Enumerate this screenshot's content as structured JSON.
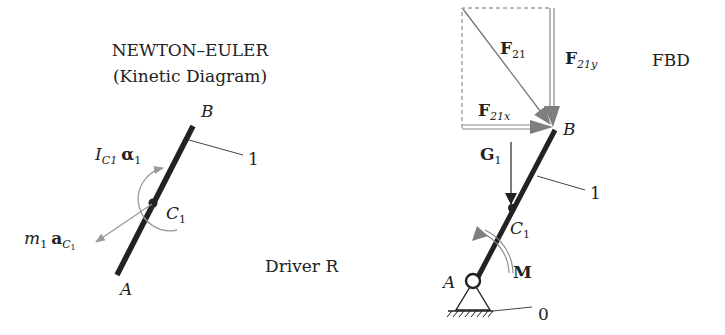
{
  "left_panel": {
    "title_line1": "NEWTON–EULER",
    "title_line2": "(Kinetic Diagram)",
    "point_B": "B",
    "point_A": "A",
    "point_C": "C",
    "point_C_sub": "1",
    "link_label": "1",
    "inertia_I": "I",
    "inertia_I_sub": "C1",
    "inertia_alpha": "α",
    "inertia_alpha_sub": "1",
    "mass_m": "m",
    "mass_m_sub": "1",
    "mass_a": "a",
    "mass_a_sub": "C",
    "mass_a_subsub": "1",
    "driver_label": "Driver R"
  },
  "right_panel": {
    "fbd_label": "FBD",
    "force_F": "F",
    "force_F21_sub": "21",
    "force_F21x_sub": "21x",
    "force_F21y_sub": "21y",
    "gravity_G": "G",
    "gravity_G_sub": "1",
    "point_B": "B",
    "point_A": "A",
    "point_C": "C",
    "point_C_sub": "1",
    "link_label": "1",
    "ground_label": "0",
    "moment_label": "M"
  },
  "colors": {
    "link": "#222222",
    "arrow_gray": "#8a8a8a",
    "text": "#222222"
  }
}
